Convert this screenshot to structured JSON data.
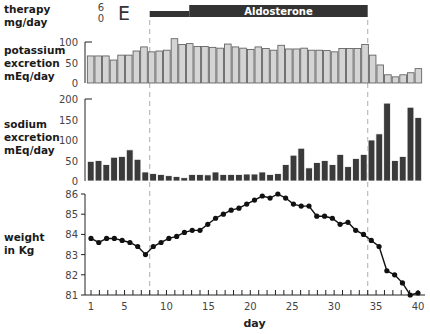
{
  "panel_letter": "E",
  "labels": {
    "therapy": "therapy\nmg/day",
    "potassium": "potassium\nexcretion\nmEq/day",
    "sodium": "sodium\nexcretion\nmEq/day",
    "weight": "weight\nin Kg",
    "xlabel": "day"
  },
  "therapy": {
    "name": "Aldosterone",
    "ticks": [
      "6",
      "0"
    ],
    "low_segment": {
      "start_day": 8,
      "end_day": 12
    },
    "high_segment": {
      "start_day": 12,
      "end_day": 34
    }
  },
  "colors": {
    "potassium_bar": "#d4d4d4",
    "sodium_bar": "#3a3a3a",
    "line": "#111111",
    "therapy_bar": "#333333",
    "dashed": "#bbbbbb"
  },
  "chart_data": [
    {
      "type": "bar",
      "title": "potassium excretion",
      "ylabel": "potassium excretion mEq/day",
      "xlabel": "day",
      "ylim": [
        0,
        100
      ],
      "yticks": [
        0,
        50,
        100
      ],
      "x": [
        1,
        2,
        3,
        4,
        5,
        6,
        7,
        8,
        9,
        10,
        11,
        12,
        13,
        14,
        15,
        16,
        17,
        18,
        19,
        20,
        21,
        22,
        23,
        24,
        25,
        26,
        27,
        28,
        29,
        30,
        31,
        32,
        33,
        34,
        35,
        36,
        37,
        38,
        39,
        40
      ],
      "values": [
        66,
        66,
        66,
        56,
        68,
        68,
        78,
        88,
        76,
        78,
        80,
        108,
        94,
        96,
        89,
        89,
        87,
        85,
        95,
        88,
        85,
        82,
        88,
        84,
        80,
        92,
        83,
        83,
        85,
        80,
        80,
        79,
        76,
        84,
        84,
        84,
        94,
        68,
        44,
        20,
        15,
        20,
        25,
        35
      ],
      "annotations": [
        "dashed line at day 8 (aldosterone start)",
        "dashed line at day 34 (aldosterone stop)"
      ]
    },
    {
      "type": "bar",
      "title": "sodium excretion",
      "ylabel": "sodium excretion mEq/day",
      "xlabel": "day",
      "ylim": [
        0,
        200
      ],
      "yticks": [
        0,
        50,
        100,
        150,
        200
      ],
      "x": [
        1,
        2,
        3,
        4,
        5,
        6,
        7,
        8,
        9,
        10,
        11,
        12,
        13,
        14,
        15,
        16,
        17,
        18,
        19,
        20,
        21,
        22,
        23,
        24,
        25,
        26,
        27,
        28,
        29,
        30,
        31,
        32,
        33,
        34,
        35,
        36,
        37,
        38,
        39,
        40
      ],
      "values": [
        48,
        50,
        40,
        58,
        60,
        76,
        53,
        22,
        18,
        16,
        13,
        11,
        8,
        16,
        16,
        15,
        22,
        16,
        16,
        16,
        17,
        17,
        22,
        16,
        18,
        40,
        63,
        80,
        32,
        45,
        50,
        40,
        65,
        35,
        55,
        65,
        100,
        115,
        190,
        50,
        60,
        180,
        155
      ]
    },
    {
      "type": "line",
      "title": "weight",
      "ylabel": "weight in Kg",
      "xlabel": "day",
      "ylim": [
        81,
        86
      ],
      "yticks": [
        81,
        82,
        83,
        84,
        85,
        86
      ],
      "xticks": [
        1,
        5,
        10,
        15,
        20,
        25,
        30,
        35,
        40
      ],
      "x": [
        1,
        2,
        3,
        4,
        5,
        6,
        7,
        8,
        9,
        10,
        11,
        12,
        13,
        14,
        15,
        16,
        17,
        18,
        19,
        20,
        21,
        22,
        23,
        24,
        25,
        26,
        27,
        28,
        29,
        30,
        31,
        32,
        33,
        34,
        35,
        36,
        37,
        38,
        39,
        40
      ],
      "values": [
        83.8,
        83.6,
        83.8,
        83.8,
        83.7,
        83.6,
        83.4,
        83.0,
        83.4,
        83.6,
        83.8,
        83.9,
        84.1,
        84.2,
        84.2,
        84.5,
        84.8,
        85.0,
        85.2,
        85.3,
        85.5,
        85.7,
        85.9,
        85.8,
        86.0,
        85.8,
        85.5,
        85.4,
        85.4,
        84.9,
        84.9,
        84.8,
        84.5,
        84.6,
        84.2,
        84.0,
        83.7,
        83.4,
        82.2,
        82.0,
        81.6,
        81.0,
        81.1
      ]
    }
  ]
}
